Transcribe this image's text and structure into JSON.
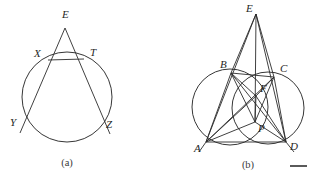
{
  "figure_a": {
    "caption": "(a)",
    "labels": {
      "apex": "E",
      "left_near": "X",
      "right_near": "T",
      "left_far": "Y",
      "right_far": "Z"
    },
    "geometry": {
      "circle": {
        "cx": 67,
        "cy": 97,
        "r": 45
      },
      "apex_point": {
        "x": 65,
        "y": 28
      },
      "points": {
        "E": {
          "x": 65,
          "y": 28
        },
        "X": {
          "x": 48,
          "y": 60
        },
        "T": {
          "x": 84,
          "y": 59
        },
        "Y": {
          "x": 26,
          "y": 122
        },
        "Z": {
          "x": 104,
          "y": 123
        }
      },
      "line_EY_end": {
        "x": 20,
        "y": 133
      },
      "line_EZ_end": {
        "x": 110,
        "y": 134
      },
      "chord_XT": true
    },
    "label_positions": {
      "E": {
        "x": 62,
        "y": 18
      },
      "X": {
        "x": 34,
        "y": 57
      },
      "T": {
        "x": 90,
        "y": 56
      },
      "Y": {
        "x": 10,
        "y": 126
      },
      "Z": {
        "x": 106,
        "y": 128
      }
    },
    "caption_position": {
      "x": 67,
      "y": 166
    }
  },
  "figure_b": {
    "caption": "(b)",
    "labels": {
      "apex": "E",
      "top_left": "B",
      "top_right": "C",
      "bottom_left": "A",
      "bottom_right": "D",
      "inner_upper": "F",
      "inner_lower": "P"
    },
    "geometry": {
      "points": {
        "E": {
          "x": 100,
          "y": 14
        },
        "B": {
          "x": 75,
          "y": 73
        },
        "C": {
          "x": 118,
          "y": 77
        },
        "A": {
          "x": 50,
          "y": 142
        },
        "D": {
          "x": 130,
          "y": 142
        },
        "F": {
          "x": 100,
          "y": 96
        },
        "P": {
          "x": 99,
          "y": 122
        }
      },
      "circles": [
        {
          "cx": 74,
          "cy": 107,
          "r": 38
        },
        {
          "cx": 112,
          "cy": 108,
          "r": 36
        }
      ],
      "segments": [
        [
          "E",
          "A"
        ],
        [
          "E",
          "D"
        ],
        [
          "E",
          "P"
        ],
        [
          "E",
          "B"
        ],
        [
          "E",
          "C"
        ],
        [
          "A",
          "B"
        ],
        [
          "B",
          "C"
        ],
        [
          "C",
          "D"
        ],
        [
          "A",
          "D"
        ],
        [
          "A",
          "C"
        ],
        [
          "B",
          "D"
        ],
        [
          "A",
          "F"
        ],
        [
          "D",
          "F"
        ],
        [
          "B",
          "P"
        ],
        [
          "C",
          "P"
        ],
        [
          "A",
          "P"
        ],
        [
          "D",
          "P"
        ],
        [
          "B",
          "F"
        ],
        [
          "C",
          "F"
        ],
        [
          "F",
          "P"
        ]
      ],
      "extensions": [
        {
          "from": "A",
          "to": {
            "x": 43,
            "y": 152
          }
        },
        {
          "from": "D",
          "to": {
            "x": 138,
            "y": 152
          }
        }
      ]
    },
    "label_positions": {
      "E": {
        "x": 90,
        "y": 12
      },
      "B": {
        "x": 64,
        "y": 68
      },
      "C": {
        "x": 124,
        "y": 72
      },
      "A": {
        "x": 38,
        "y": 152
      },
      "D": {
        "x": 134,
        "y": 150
      },
      "F": {
        "x": 104,
        "y": 92
      },
      "P": {
        "x": 102,
        "y": 132
      }
    },
    "caption_position": {
      "x": 92,
      "y": 168
    }
  },
  "colors": {
    "stroke": "#2b2b2b",
    "label": "#262626",
    "caption": "#3a3a3a",
    "background": "#ffffff"
  }
}
